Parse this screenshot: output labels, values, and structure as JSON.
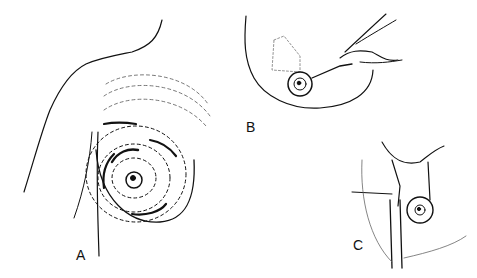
{
  "figure": {
    "panels": [
      {
        "id": "A",
        "label": "A",
        "description": "breast with concentric dashed marking lines around nipple-areola"
      },
      {
        "id": "B",
        "label": "B",
        "description": "hand holding scalpel incising around areola with dotted de-epithelialized area"
      },
      {
        "id": "C",
        "label": "C",
        "description": "retracted tissue flap with instrument and areola"
      }
    ],
    "colors": {
      "ink": "#111111",
      "background": "#ffffff",
      "stipple": "#888888"
    }
  }
}
